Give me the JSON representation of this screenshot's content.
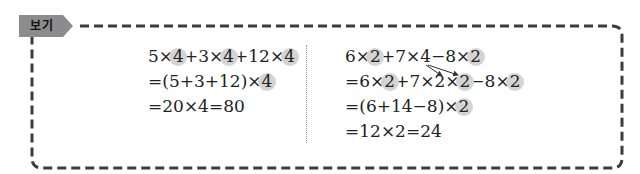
{
  "tag": {
    "label": "보기"
  },
  "colors": {
    "tag_fill": "#8c8c8c",
    "border": "#3c3c3c",
    "highlight": "#d4d4d4",
    "text": "#222222"
  },
  "left": {
    "lines": [
      {
        "parts": [
          "5×",
          "4",
          "+3×",
          "4",
          "+12×",
          "4"
        ]
      },
      {
        "parts": [
          "=(5+3+12)×",
          "4"
        ]
      },
      {
        "parts": [
          "=20×4=80"
        ]
      }
    ]
  },
  "right": {
    "lines": [
      {
        "parts": [
          "6×",
          "2",
          "+7×4−8×",
          "2"
        ]
      },
      {
        "parts": [
          "=6×",
          "2",
          "+7×2×",
          "2",
          "−8×",
          "2"
        ]
      },
      {
        "parts": [
          "=(6+14−8)×",
          "2"
        ]
      },
      {
        "parts": [
          "=12×2=24"
        ]
      }
    ],
    "annotation": "arrows from 4 to 2×2"
  }
}
